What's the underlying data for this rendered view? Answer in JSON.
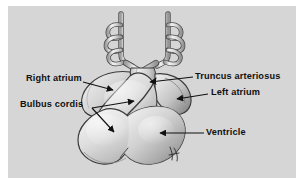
{
  "figure": {
    "panel_background": "#d6d6d6",
    "page_background": "#ffffff",
    "ink_color": "#111111",
    "tissue_light": "#ececec",
    "tissue_mid": "#c9c9c9",
    "tissue_dark": "#8e8e8e",
    "signature": "artist-monogram"
  },
  "labels": [
    {
      "id": "right-atrium",
      "text": "Right atrium",
      "side": "left",
      "arrow": "points right and slightly down into the right atrial bulge"
    },
    {
      "id": "bulbus-cordis",
      "text": "Bulbus cordis",
      "side": "left",
      "arrow": "two arrows from one origin: one up-right, one down-right"
    },
    {
      "id": "truncus-arteriosus",
      "text": "Truncus arteriosus",
      "side": "right",
      "arrow": "points left to the outflow tract at top center"
    },
    {
      "id": "left-atrium",
      "text": "Left atrium",
      "side": "right",
      "arrow": "points left into the left atrial bulge"
    },
    {
      "id": "ventricle",
      "text": "Ventricle",
      "side": "right",
      "arrow": "points left into the large lower ventricular mass"
    }
  ],
  "structures": [
    "dorsal aorta (left)",
    "dorsal aorta (right)",
    "aortic arch loops",
    "truncus arteriosus",
    "right atrium",
    "left atrium",
    "bulbus cordis",
    "ventricle"
  ]
}
